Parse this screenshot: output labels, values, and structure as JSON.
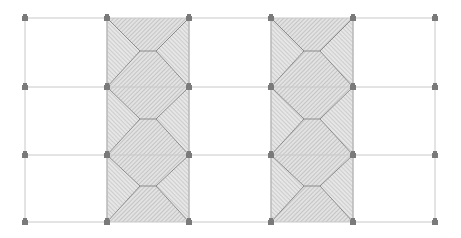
{
  "diagram": {
    "type": "roof-plan-grid",
    "width": 461,
    "height": 238,
    "colors": {
      "background": "#ffffff",
      "grid_line": "#c8c8c8",
      "roof_fill": "#d9d9d9",
      "hatch": "#a8a8a8",
      "ridge_line": "#8c8c8c",
      "node": "#7a7a7a"
    },
    "grid": {
      "x": [
        25,
        107,
        189,
        271,
        353,
        435
      ],
      "y": [
        18,
        87,
        155,
        222
      ]
    },
    "shaded_columns": [
      {
        "x0": 107,
        "x1": 189
      },
      {
        "x0": 271,
        "x1": 353
      }
    ],
    "rows": [
      {
        "y0": 18,
        "y1": 87,
        "ridge_y": 51
      },
      {
        "y0": 87,
        "y1": 155,
        "ridge_y": 119
      },
      {
        "y0": 155,
        "y1": 222,
        "ridge_y": 186
      }
    ],
    "ridge_inset": 33,
    "node_icon": "support-node-icon"
  }
}
